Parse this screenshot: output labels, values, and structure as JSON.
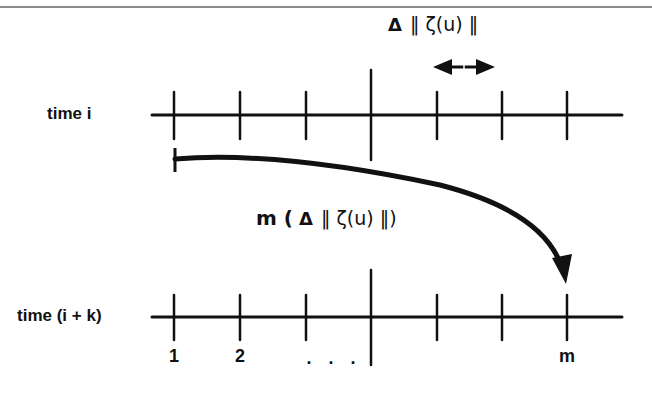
{
  "figure": {
    "rows": [
      {
        "id": "top",
        "label": "time i",
        "y": 115
      },
      {
        "id": "bottom",
        "label": "time (i + k)",
        "y": 317
      }
    ],
    "tick_x": [
      174,
      240,
      306,
      371,
      437,
      502,
      567
    ],
    "long_tick_index": 3,
    "bottom_tick_labels": [
      {
        "text": "1",
        "x": 174
      },
      {
        "text": "2",
        "x": 240
      },
      {
        "text": ". . .",
        "x": 334
      },
      {
        "text": "m",
        "x": 567
      }
    ],
    "top_annotation": {
      "delta": "Δ",
      "norm": "‖ ζ(u) ‖"
    },
    "arrow_annotation": {
      "prefix": "m (",
      "delta": "Δ",
      "norm": "‖ ζ(u) ‖)"
    },
    "colors": {
      "line": "#111111",
      "background": "#ffffff",
      "top_rule": "#555555"
    }
  }
}
